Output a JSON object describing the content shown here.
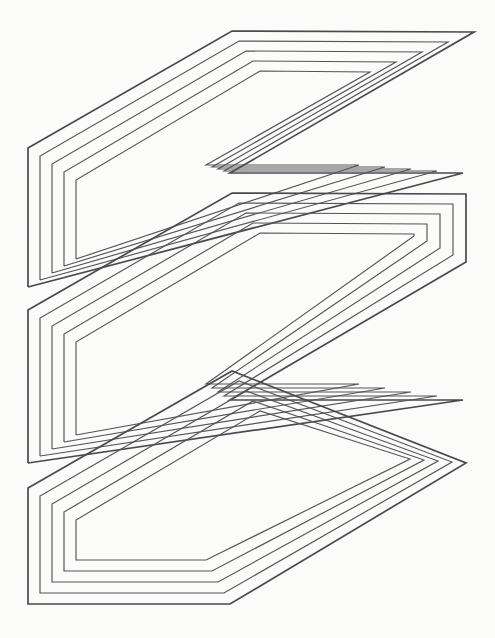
{
  "canvas": {
    "width": 495,
    "height": 638,
    "background_color": "#fbfbfa",
    "title": "Three stacked spiral parallelogram bands"
  },
  "style": {
    "stroke_color": "#555558",
    "outer_stroke_color": "#4a4a4e",
    "stroke_width": 1.15,
    "outer_stroke_width": 1.7,
    "fill": "none"
  },
  "figure": {
    "type": "line-art",
    "shape_name": "nested-spiral-parallelograms",
    "band_count": 3,
    "loops_per_band": 5
  },
  "bands": [
    {
      "name": "band-top",
      "loop_count": 5,
      "loops": [
        {
          "name": "band-top-loop-1",
          "outer": true,
          "d": "M 28 148 L 232 31 L 475 32 L 230 173 L 463 173 L 28 424 Z"
        },
        {
          "name": "band-top-loop-2",
          "outer": false,
          "d": "M 43 157 L 239 44 L 449 45 L 217 179 L 437 179 L 43 403 Z"
        },
        {
          "name": "band-top-loop-3",
          "outer": false,
          "d": "M 58 166 L 246 57 L 423 58 L 204 185 L 411 185 L 58 382 Z"
        },
        {
          "name": "band-top-loop-4",
          "outer": false,
          "d": "M 73 175 L 253 70 L 397 71 L 191 191 L 385 191 L 73 361 Z"
        },
        {
          "name": "band-top-loop-5",
          "outer": false,
          "d": "M 88 184 L 260 83 L 371 84 L 178 197 L 359 197 L 88 340 Z"
        }
      ]
    },
    {
      "name": "band-middle",
      "loop_count": 5,
      "loops": [
        {
          "name": "band-middle-loop-1",
          "outer": true,
          "d": "M 28 287 L 232 170 L 467 62 L 467 262 L 230 400 L 463 400 L 28 463 Z"
        }
      ]
    },
    {
      "name": "band-bottom",
      "loop_count": 5,
      "loops": [
        {
          "name": "band-bottom-loop-1",
          "outer": true,
          "d": "M 28 488 L 232 371 L 467 463 L 230 604 Z"
        }
      ]
    }
  ],
  "geometry": {
    "description": "Three parallelogram bands, each drawn as a 5-turn rectangular spiral slanting up to the right at roughly 30 degrees.",
    "band_tops": [
      32,
      262,
      463
    ],
    "band_lefts": [
      28,
      28,
      28
    ],
    "band_rights": [
      475,
      467,
      467
    ],
    "shear_dx": 204,
    "shear_dy": -117,
    "ring_gap": 9
  }
}
